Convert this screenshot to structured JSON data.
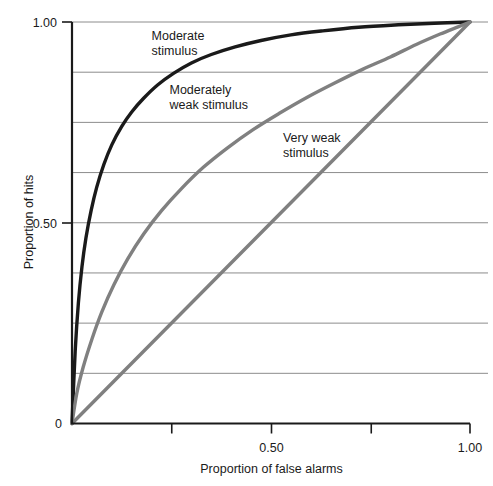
{
  "chart_data": {
    "type": "line",
    "title": "",
    "xlabel": "Proportion of false alarms",
    "ylabel": "Proportion of hits",
    "xlim": [
      0,
      1
    ],
    "ylim": [
      0,
      1
    ],
    "grid": true,
    "grid_axis": "y",
    "grid_step": 0.125,
    "legend": "inline-annotations",
    "xticks": [
      0,
      0.25,
      0.5,
      0.75,
      1.0
    ],
    "xtick_labels": [
      "0",
      "",
      "0.50",
      "",
      "1.00"
    ],
    "yticks": [
      0,
      0.5,
      1.0
    ],
    "ytick_labels": [
      "0",
      "0.50",
      "1.00"
    ],
    "series": [
      {
        "name": "Moderate stimulus",
        "color": "#1a1a1a",
        "width": 3.4,
        "label_lines": [
          "Moderate",
          "stimulus"
        ],
        "label_x": 0.2,
        "label_y": 0.955,
        "points": [
          [
            0.0,
            0.0
          ],
          [
            0.008,
            0.18
          ],
          [
            0.016,
            0.3
          ],
          [
            0.025,
            0.39
          ],
          [
            0.035,
            0.462
          ],
          [
            0.048,
            0.53
          ],
          [
            0.062,
            0.588
          ],
          [
            0.08,
            0.645
          ],
          [
            0.1,
            0.694
          ],
          [
            0.125,
            0.74
          ],
          [
            0.15,
            0.776
          ],
          [
            0.18,
            0.81
          ],
          [
            0.215,
            0.843
          ],
          [
            0.255,
            0.872
          ],
          [
            0.3,
            0.898
          ],
          [
            0.35,
            0.919
          ],
          [
            0.41,
            0.938
          ],
          [
            0.475,
            0.954
          ],
          [
            0.55,
            0.968
          ],
          [
            0.63,
            0.978
          ],
          [
            0.72,
            0.987
          ],
          [
            0.82,
            0.993
          ],
          [
            0.91,
            0.997
          ],
          [
            1.0,
            1.0
          ]
        ]
      },
      {
        "name": "Moderately weak stimulus",
        "color": "#808080",
        "width": 3.4,
        "label_lines": [
          "Moderately",
          "weak stimulus"
        ],
        "label_x": 0.245,
        "label_y": 0.82,
        "points": [
          [
            0.0,
            0.0
          ],
          [
            0.012,
            0.075
          ],
          [
            0.028,
            0.14
          ],
          [
            0.05,
            0.21
          ],
          [
            0.075,
            0.278
          ],
          [
            0.105,
            0.345
          ],
          [
            0.14,
            0.41
          ],
          [
            0.18,
            0.472
          ],
          [
            0.225,
            0.53
          ],
          [
            0.275,
            0.585
          ],
          [
            0.33,
            0.638
          ],
          [
            0.39,
            0.686
          ],
          [
            0.455,
            0.732
          ],
          [
            0.52,
            0.772
          ],
          [
            0.59,
            0.812
          ],
          [
            0.66,
            0.848
          ],
          [
            0.73,
            0.882
          ],
          [
            0.8,
            0.913
          ],
          [
            0.865,
            0.944
          ],
          [
            0.925,
            0.97
          ],
          [
            0.97,
            0.988
          ],
          [
            1.0,
            1.0
          ]
        ]
      },
      {
        "name": "Very weak stimulus",
        "color": "#808080",
        "width": 3.4,
        "label_lines": [
          "Very weak",
          "stimulus"
        ],
        "label_x": 0.53,
        "label_y": 0.7,
        "points": [
          [
            0.0,
            0.0
          ],
          [
            1.0,
            1.0
          ]
        ]
      }
    ]
  },
  "axes": {
    "y_title": "Proportion of hits",
    "x_title": "Proportion of false alarms",
    "y_labels": {
      "top": "1.00",
      "mid": "0.50",
      "zero": "0"
    },
    "x_labels": {
      "zero": "0",
      "mid": "0.50",
      "max": "1.00"
    }
  },
  "colors": {
    "axis": "#1a1a1a",
    "grid": "#8c8c8c",
    "curve_dark": "#1a1a1a",
    "curve_gray": "#808080",
    "background": "#ffffff"
  }
}
